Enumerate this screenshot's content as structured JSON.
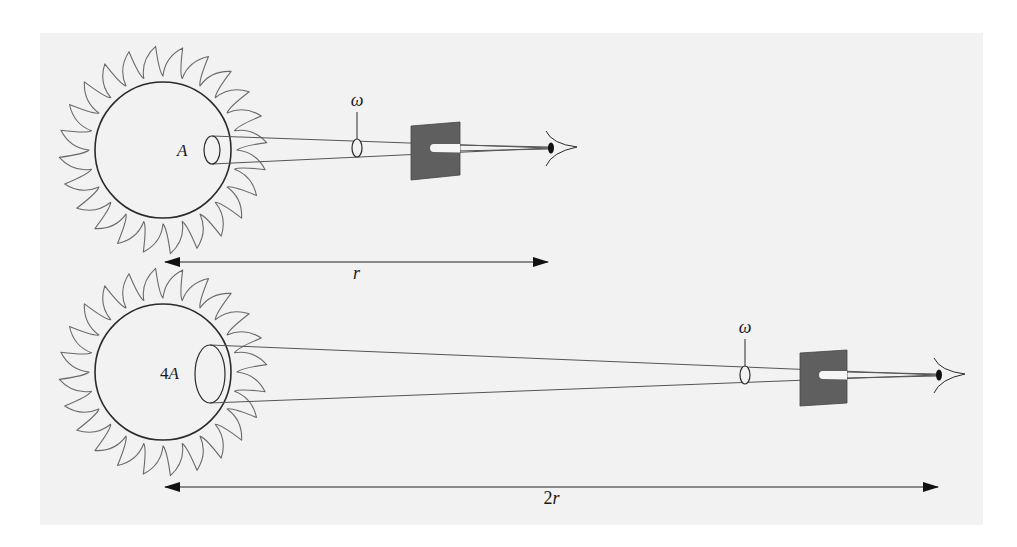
{
  "figure": {
    "panel": {
      "x": 40,
      "y": 33,
      "width": 943,
      "height": 492,
      "color": "#f2f2f2"
    },
    "colors": {
      "ink": "#2b2b2b",
      "ray_stroke": "#555555",
      "screen_fill": "#5f5f5f",
      "pupil": "#111111",
      "background": "#ffffff"
    }
  },
  "scenes": [
    {
      "id": "near",
      "sun": {
        "cx": 163,
        "cy": 150,
        "r": 68,
        "ray_outer": 104,
        "ray_count": 24
      },
      "area_label": "A",
      "area_ellipse": {
        "cx": 212,
        "cy": 150,
        "rx": 8,
        "ry": 14
      },
      "cone_end_x": 267,
      "lens": {
        "cx": 357,
        "cy": 148,
        "rx": 5,
        "ry": 9
      },
      "solid_angle_label": "ω",
      "screen": {
        "x1": 411,
        "x2": 460,
        "top_left": 126,
        "top_right": 122,
        "bottom_right": 175,
        "bottom_left": 180
      },
      "eye": {
        "x": 550,
        "y": 148
      },
      "distance_label": "r",
      "arrow": {
        "x1": 163,
        "x2": 550,
        "y": 262
      }
    },
    {
      "id": "far",
      "sun": {
        "cx": 163,
        "cy": 372,
        "r": 68,
        "ray_outer": 104,
        "ray_count": 24
      },
      "area_label": "4A",
      "area_ellipse": {
        "cx": 210,
        "cy": 374,
        "rx": 15,
        "ry": 29
      },
      "cone_end_x": 267,
      "lens": {
        "cx": 745,
        "cy": 375,
        "rx": 5,
        "ry": 9
      },
      "solid_angle_label": "ω",
      "screen": {
        "x1": 800,
        "x2": 847,
        "top_left": 353,
        "top_right": 350,
        "bottom_right": 403,
        "bottom_left": 406
      },
      "eye": {
        "x": 938,
        "y": 375
      },
      "distance_label": "2r",
      "arrow": {
        "x1": 163,
        "x2": 940,
        "y": 487
      }
    }
  ]
}
